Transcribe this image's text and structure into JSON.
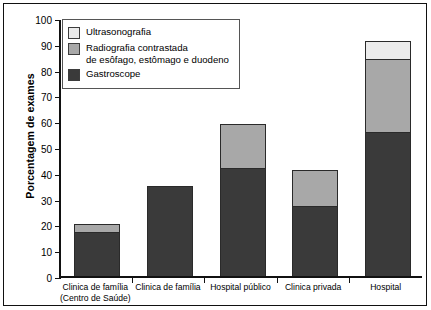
{
  "chart_data": {
    "type": "bar",
    "stacked": true,
    "title": "",
    "xlabel": "",
    "ylabel": "Porcentagem de exames",
    "ylim": [
      0,
      100
    ],
    "yticks": [
      0,
      10,
      20,
      30,
      40,
      50,
      60,
      70,
      80,
      90,
      100
    ],
    "grid": false,
    "legend_position": "upper-left-inside",
    "categories": [
      "Clinica de família\n(Centro de Saúde)",
      "Clinica de família",
      "Hospital público",
      "Clinica privada",
      "Hospital"
    ],
    "category_lines": [
      [
        "Clinica de família",
        "(Centro de Saúde)"
      ],
      [
        "Clinica de família"
      ],
      [
        "Hospital público"
      ],
      [
        "Clinica privada"
      ],
      [
        "Hospital"
      ]
    ],
    "series": [
      {
        "name": "Gastroscope",
        "color": "#3a3a3a",
        "values": [
          17,
          35,
          42,
          27,
          56
        ]
      },
      {
        "name": "Radiografia contrastada de esôfago, estômago e duodeno",
        "color": "#a8a8a8",
        "values": [
          3,
          0,
          17,
          14,
          28
        ]
      },
      {
        "name": "Ultrasonografia",
        "color": "#ebebeb",
        "values": [
          0,
          0,
          0,
          0,
          7
        ]
      }
    ],
    "totals": [
      20,
      35,
      59,
      41,
      91
    ]
  },
  "legend": {
    "entries": [
      {
        "label_line1": "Ultrasonografia",
        "label_line2": "",
        "swatch": "s2"
      },
      {
        "label_line1": "Radiografia contrastada",
        "label_line2": "de esôfago, estômago e duodeno",
        "swatch": "s1"
      },
      {
        "label_line1": "Gastroscope",
        "label_line2": "",
        "swatch": "s0"
      }
    ]
  }
}
